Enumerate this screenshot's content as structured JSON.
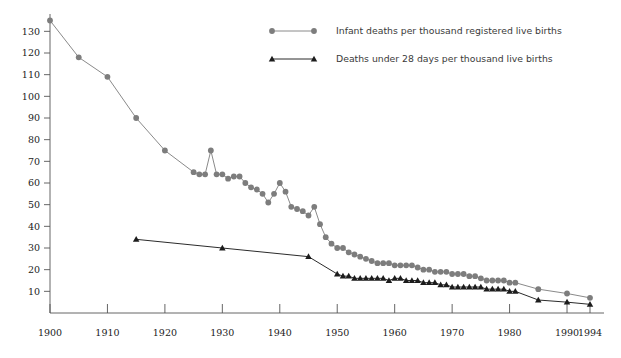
{
  "chart_data": {
    "type": "line",
    "title": "",
    "subtitle": "",
    "xlabel": "",
    "ylabel": "",
    "grid": false,
    "legend_position": "top-center",
    "xlim": [
      1900,
      1994
    ],
    "ylim": [
      0,
      138
    ],
    "yticks": [
      10,
      20,
      30,
      40,
      50,
      60,
      70,
      80,
      90,
      100,
      110,
      120,
      130
    ],
    "ytick_labels": [
      "10",
      "20",
      "30",
      "40",
      "50",
      "60",
      "70",
      "80",
      "90",
      "100",
      "110",
      "120",
      "130"
    ],
    "xticks": [
      1900,
      1910,
      1920,
      1930,
      1940,
      1950,
      1960,
      1970,
      1980,
      1990,
      1994
    ],
    "xtick_labels": [
      "1900",
      "1910",
      "1920",
      "1930",
      "1940",
      "1950",
      "1960",
      "1970",
      "1980",
      "1990",
      "1994"
    ],
    "series": [
      {
        "name": "Infant deaths per thousand registered live births",
        "marker": "circle",
        "color": "#7d7d7d",
        "line_color": "#8a8a8a",
        "x": [
          1900,
          1905,
          1910,
          1915,
          1920,
          1925,
          1926,
          1927,
          1928,
          1929,
          1930,
          1931,
          1932,
          1933,
          1934,
          1935,
          1936,
          1937,
          1938,
          1939,
          1940,
          1941,
          1942,
          1943,
          1944,
          1945,
          1946,
          1947,
          1948,
          1949,
          1950,
          1951,
          1952,
          1953,
          1954,
          1955,
          1956,
          1957,
          1958,
          1959,
          1960,
          1961,
          1962,
          1963,
          1964,
          1965,
          1966,
          1967,
          1968,
          1969,
          1970,
          1971,
          1972,
          1973,
          1974,
          1975,
          1976,
          1977,
          1978,
          1979,
          1980,
          1981,
          1985,
          1990,
          1994
        ],
        "y": [
          135,
          118,
          109,
          90,
          75,
          65,
          64,
          64,
          75,
          64,
          64,
          62,
          63,
          63,
          60,
          58,
          57,
          55,
          51,
          55,
          60,
          56,
          49,
          48,
          47,
          45,
          49,
          41,
          35,
          32,
          30,
          30,
          28,
          27,
          26,
          25,
          24,
          23,
          23,
          23,
          22,
          22,
          22,
          22,
          21,
          20,
          20,
          19,
          19,
          19,
          18,
          18,
          18,
          17,
          17,
          16,
          15,
          15,
          15,
          15,
          14,
          14,
          11,
          9,
          7
        ]
      },
      {
        "name": "Deaths under 28 days per thousand live births",
        "marker": "triangle",
        "color": "#1c1c1c",
        "line_color": "#2b2b2b",
        "x": [
          1915,
          1930,
          1945,
          1950,
          1951,
          1952,
          1953,
          1954,
          1955,
          1956,
          1957,
          1958,
          1959,
          1960,
          1961,
          1962,
          1963,
          1964,
          1965,
          1966,
          1967,
          1968,
          1969,
          1970,
          1971,
          1972,
          1973,
          1974,
          1975,
          1976,
          1977,
          1978,
          1979,
          1980,
          1981,
          1985,
          1990,
          1994
        ],
        "y": [
          34,
          30,
          26,
          18,
          17,
          17,
          16,
          16,
          16,
          16,
          16,
          16,
          15,
          16,
          16,
          15,
          15,
          15,
          14,
          14,
          14,
          13,
          13,
          12,
          12,
          12,
          12,
          12,
          12,
          11,
          11,
          11,
          11,
          10,
          10,
          6,
          5,
          4
        ]
      }
    ]
  },
  "legend": {
    "items": [
      {
        "label": "Infant deaths per thousand registered live births",
        "marker": "circle"
      },
      {
        "label": "Deaths under 28 days per thousand live births",
        "marker": "triangle"
      }
    ]
  },
  "colors": {
    "series_a": "#7d7d7d",
    "series_b": "#1c1c1c",
    "axis": "#555555",
    "background": "#ffffff"
  }
}
